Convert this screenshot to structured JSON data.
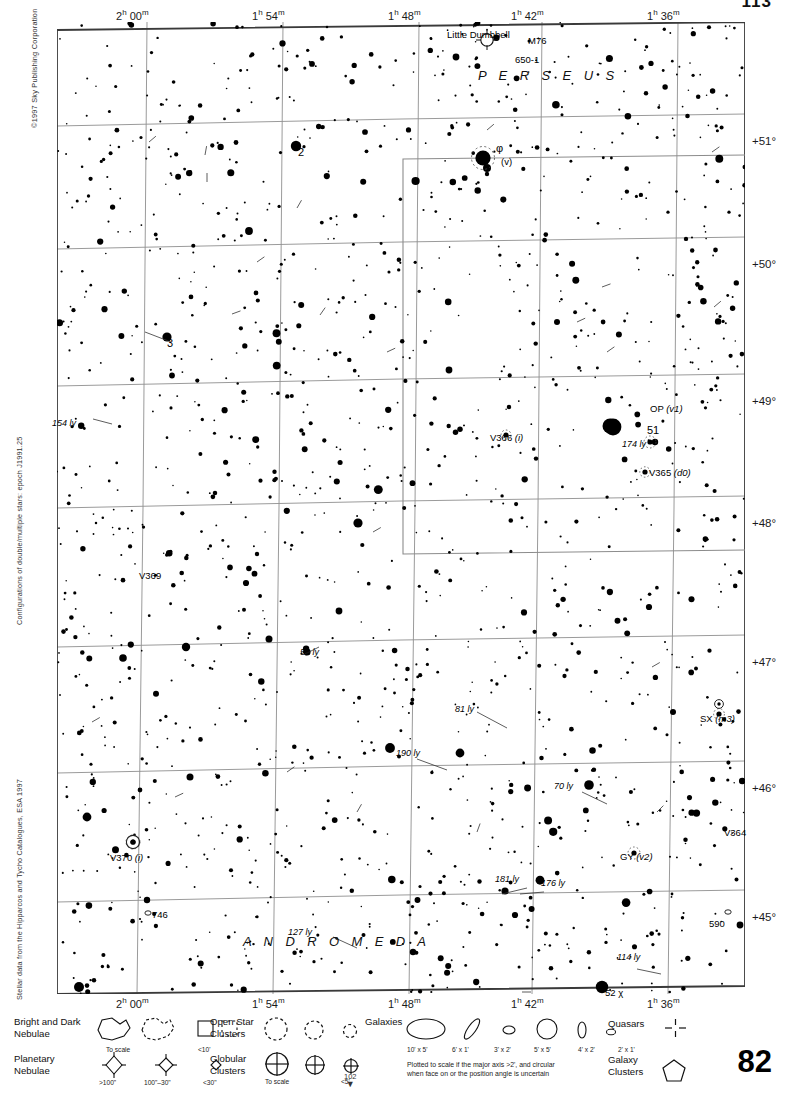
{
  "page": {
    "number_bottom": "82",
    "number_top": "113",
    "next_page_marker": "102",
    "next_page_arrow": "▼",
    "copyright": "©1997 Sky Publishing Corporation",
    "credit_double_stars": "Configurations of double/multiple stars: epoch J1991.25",
    "credit_stellar_data": "Stellar data from the Hipparcos and Tycho Catalogues, ESA 1997"
  },
  "axes": {
    "ra_ticks": [
      {
        "label": "2h 00m",
        "h": "2",
        "m": "00",
        "x": 142
      },
      {
        "label": "1h 54m",
        "h": "1",
        "m": "54",
        "x": 278
      },
      {
        "label": "1h 48m",
        "h": "1",
        "m": "48",
        "x": 414
      },
      {
        "label": "1h 42m",
        "h": "1",
        "m": "42",
        "x": 537
      },
      {
        "label": "1h 36m",
        "h": "1",
        "m": "36",
        "x": 673
      }
    ],
    "dec_ticks": [
      {
        "label": "+51°",
        "y": 120
      },
      {
        "label": "+50°",
        "y": 243
      },
      {
        "label": "+49°",
        "y": 380
      },
      {
        "label": "+48°",
        "y": 502
      },
      {
        "label": "+47°",
        "y": 641
      },
      {
        "label": "+46°",
        "y": 767
      },
      {
        "label": "+45°",
        "y": 896
      }
    ]
  },
  "constellations": [
    {
      "name": "P E R S E U S",
      "x": 478,
      "y": 68
    },
    {
      "name": "A N D R O M E D A",
      "x": 243,
      "y": 934
    }
  ],
  "objects": [
    {
      "name": "Little Dumbbell",
      "x": 447,
      "y": 29,
      "type": "label"
    },
    {
      "name": "M76",
      "x": 528,
      "y": 35,
      "type": "label"
    },
    {
      "name": "650-1",
      "x": 515,
      "y": 54,
      "type": "label"
    },
    {
      "name": "φ",
      "x": 496,
      "y": 142,
      "type": "greek"
    },
    {
      "name": "(v)",
      "x": 501,
      "y": 156,
      "type": "italic"
    },
    {
      "name": "2",
      "x": 298,
      "y": 146,
      "type": "number"
    },
    {
      "name": "3",
      "x": 167,
      "y": 337,
      "type": "number"
    },
    {
      "name": "154 ly",
      "x": 52,
      "y": 418,
      "type": "distance"
    },
    {
      "name": "OP (v1)",
      "x": 650,
      "y": 403,
      "type": "variable"
    },
    {
      "name": "51",
      "x": 647,
      "y": 424,
      "type": "number"
    },
    {
      "name": "174 ly",
      "x": 622,
      "y": 439,
      "type": "distance"
    },
    {
      "name": "V366 (i)",
      "x": 490,
      "y": 432,
      "type": "variable"
    },
    {
      "name": "V365 (d0)",
      "x": 649,
      "y": 467,
      "type": "variable"
    },
    {
      "name": "V369",
      "x": 139,
      "y": 570,
      "type": "variable"
    },
    {
      "name": "52 ly",
      "x": 300,
      "y": 647,
      "type": "distance"
    },
    {
      "name": "81 ly",
      "x": 455,
      "y": 704,
      "type": "distance"
    },
    {
      "name": "SX (m3)",
      "x": 700,
      "y": 713,
      "type": "variable"
    },
    {
      "name": "190 ly",
      "x": 396,
      "y": 748,
      "type": "distance"
    },
    {
      "name": "70 ly",
      "x": 554,
      "y": 781,
      "type": "distance"
    },
    {
      "name": "V364",
      "x": 724,
      "y": 827,
      "type": "variable"
    },
    {
      "name": "V370 (i)",
      "x": 110,
      "y": 852,
      "type": "variable"
    },
    {
      "name": "GY (v2)",
      "x": 620,
      "y": 851,
      "type": "variable"
    },
    {
      "name": "181 ly",
      "x": 495,
      "y": 874,
      "type": "distance"
    },
    {
      "name": "176 ly",
      "x": 541,
      "y": 878,
      "type": "distance"
    },
    {
      "name": "746",
      "x": 152,
      "y": 909,
      "type": "label"
    },
    {
      "name": "590",
      "x": 709,
      "y": 918,
      "type": "label"
    },
    {
      "name": "127 ly",
      "x": 288,
      "y": 927,
      "type": "distance"
    },
    {
      "name": "114 ly",
      "x": 617,
      "y": 952,
      "type": "distance"
    },
    {
      "name": "52 χ",
      "x": 605,
      "y": 987,
      "type": "label"
    }
  ],
  "legend": {
    "nebulae_bright_dark": {
      "title": "Bright and Dark\nNebulae",
      "sub_to_scale": "To scale",
      "sub_small": "<10'"
    },
    "planetary_nebulae": {
      "title": "Planetary\nNebulae",
      "sizes": [
        ">100\"",
        "100\"–30\"",
        "<30\""
      ]
    },
    "open_clusters": {
      "title": "Open Star\nClusters"
    },
    "globular_clusters": {
      "title": "Globular\nClusters",
      "sub_to_scale": "To scale",
      "sub_small": "<5'"
    },
    "galaxies": {
      "title": "Galaxies",
      "sizes": [
        "10' x 5'",
        "6' x 1'",
        "3' x 2'",
        "5' x 5'",
        "4' x 2'",
        "2' x 1'"
      ],
      "note": "Plotted to scale if the major axis >2', and circular\nwhen face on or the position angle is uncertain"
    },
    "quasars": {
      "title": "Quasars"
    },
    "galaxy_clusters": {
      "title": "Galaxy\nClusters"
    }
  },
  "colors": {
    "ink": "#000000",
    "grid": "#8f8f8f",
    "border": "#3a3a3a",
    "paper": "#ffffff"
  }
}
